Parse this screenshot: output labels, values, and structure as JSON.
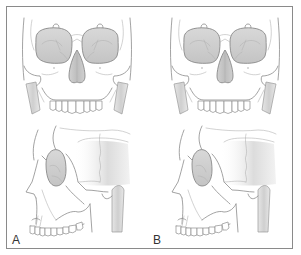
{
  "figure": {
    "panels": [
      {
        "id": "A",
        "label": "A",
        "views": [
          "frontal-skull",
          "lateral-skull"
        ]
      },
      {
        "id": "B",
        "label": "B",
        "views": [
          "frontal-skull",
          "lateral-skull"
        ]
      }
    ],
    "colors": {
      "frame": "#8a8a8a",
      "line": "#8c8c8c",
      "shade": "#c8c8c8",
      "background": "#ffffff"
    }
  }
}
